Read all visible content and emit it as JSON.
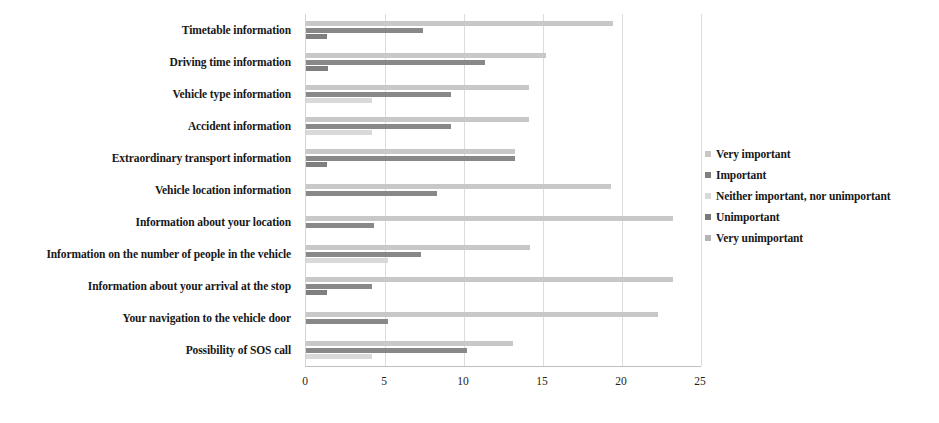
{
  "chart_data": {
    "type": "bar",
    "orientation": "horizontal",
    "title": "",
    "xlabel": "",
    "ylabel": "",
    "xlim": [
      0,
      25
    ],
    "xticks": [
      "0",
      "5",
      "10",
      "15",
      "20",
      "25"
    ],
    "grid": true,
    "legend_position": "right",
    "categories": [
      "Timetable information",
      "Driving time information",
      "Vehicle type information",
      "Accident information",
      "Extraordinary transport information",
      "Vehicle location information",
      "Information about your location",
      "Information on the number of people in the vehicle",
      "Information about your arrival at the stop",
      "Your navigation to the vehicle door",
      "Possibility of SOS call"
    ],
    "series": [
      {
        "name": "Very important",
        "color": "#c8c8c8",
        "values": [
          19.4,
          15.2,
          14.1,
          14.1,
          13.2,
          19.3,
          23.2,
          14.2,
          23.2,
          22.3,
          13.1
        ]
      },
      {
        "name": "Important",
        "color": "#888888",
        "values": [
          7.4,
          11.3,
          9.2,
          9.2,
          13.2,
          8.3,
          4.3,
          7.3,
          4.2,
          5.2,
          10.2
        ]
      },
      {
        "name": "Neither important, nor unimportant",
        "color": "#d9d9d9",
        "values": [
          0,
          0,
          4.2,
          4.2,
          0,
          0,
          0,
          5.2,
          0,
          0,
          4.2
        ]
      },
      {
        "name": "Unimportant",
        "color": "#7f7f7f",
        "values": [
          1.3,
          1.4,
          0,
          0,
          1.3,
          0,
          0,
          0,
          1.3,
          0,
          0
        ]
      },
      {
        "name": "Very unimportant",
        "color": "#bfbfbf",
        "values": [
          0,
          0,
          0,
          0,
          0,
          0,
          0,
          0,
          0,
          0,
          0
        ]
      }
    ]
  },
  "legend": {
    "items": [
      {
        "label": "Very important",
        "color": "#c8c8c8"
      },
      {
        "label": "Important",
        "color": "#808080"
      },
      {
        "label": "Neither important, nor unimportant",
        "color": "#d9d9d9"
      },
      {
        "label": "Unimportant",
        "color": "#7a7a7a"
      },
      {
        "label": "Very unimportant",
        "color": "#b5b5b5"
      }
    ]
  }
}
